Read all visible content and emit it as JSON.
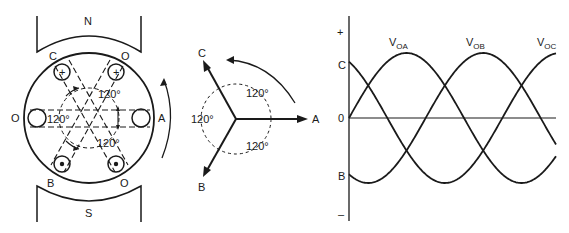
{
  "generator": {
    "pole_north": "N",
    "pole_south": "S",
    "slots": {
      "c_top": "C",
      "o_top_right": "O",
      "o_left": "O",
      "a_right": "A",
      "b_bottom": "B",
      "o_bottom_right": "O"
    },
    "conductor_marks": {
      "plus": "+",
      "dot": "•"
    },
    "angles": [
      "120°",
      "120°",
      "120°"
    ]
  },
  "phasor": {
    "labels": {
      "a": "A",
      "b": "B",
      "c": "C"
    },
    "angles": [
      "120°",
      "120°",
      "120°"
    ]
  },
  "chart_data": {
    "type": "line",
    "title": "",
    "xlabel": "",
    "ylabel": "",
    "y_tick_labels": {
      "top": "+",
      "zero": "0",
      "bottom": "–"
    },
    "axis_markers": {
      "c_level": "C",
      "b_level": "B"
    },
    "series": [
      {
        "name": "V",
        "sub": "OA",
        "phase_deg": 0
      },
      {
        "name": "V",
        "sub": "OB",
        "phase_deg": -120
      },
      {
        "name": "V",
        "sub": "OC",
        "phase_deg": 120
      }
    ],
    "x_range_deg": [
      0,
      324
    ],
    "amplitude": 1
  },
  "colors": {
    "ink": "#1a1a1a",
    "background": "#ffffff"
  }
}
